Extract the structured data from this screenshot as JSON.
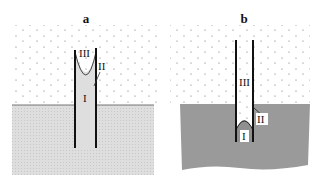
{
  "figure": {
    "panels": [
      {
        "id": "a",
        "label": "a",
        "regions": {
          "I": "I",
          "II": "II",
          "III": "III"
        },
        "description": "Capillary tube in liquid; liquid rises with concave meniscus"
      },
      {
        "id": "b",
        "label": "b",
        "regions": {
          "I": "I",
          "II": "II",
          "III": "III"
        },
        "description": "Capillary tube in liquid; liquid depressed with convex meniscus"
      }
    ],
    "colors": {
      "liquid_a": "#dcdcdc",
      "liquid_b": "#9a9a9a",
      "gas_dots": "#555555",
      "tube_wall": "#111111",
      "background": "#ffffff"
    }
  }
}
